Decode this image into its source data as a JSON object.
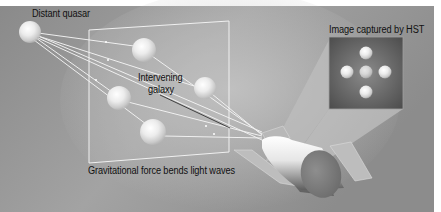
{
  "figure": {
    "colors": {
      "background": "#8f8f8f",
      "background_light": "#b4b4b4",
      "margin": "#ffffff",
      "text": "#111111",
      "light_ray": "#f4f4f4",
      "frame_line": "#f0f0f0",
      "inset_dark": "#5a5a5a"
    }
  },
  "labels": {
    "quasar": "Distant quasar",
    "galaxy_line1": "Intervening",
    "galaxy_line2": "galaxy",
    "hst_image": "Image captured by HST",
    "caption": "Gravitational force bends light waves"
  },
  "objects": {
    "quasar": {
      "name": "distant-quasar",
      "cx": 30,
      "cy": 32,
      "r": 11
    },
    "lensed_images": [
      {
        "cx": 144,
        "cy": 50,
        "r": 12
      },
      {
        "cx": 205,
        "cy": 88,
        "r": 11
      },
      {
        "cx": 119,
        "cy": 98,
        "r": 12
      },
      {
        "cx": 153,
        "cy": 132,
        "r": 13
      }
    ],
    "hst_inset_spheres": [
      {
        "cx": 366,
        "cy": 52,
        "r": 6
      },
      {
        "cx": 347,
        "cy": 72,
        "r": 6
      },
      {
        "cx": 366,
        "cy": 72,
        "r": 6
      },
      {
        "cx": 385,
        "cy": 72,
        "r": 6
      },
      {
        "cx": 366,
        "cy": 91,
        "r": 6
      }
    ]
  }
}
